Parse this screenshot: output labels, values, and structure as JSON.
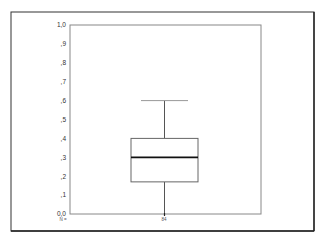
{
  "chart_data": {
    "type": "box",
    "title": "",
    "xlabel": "",
    "ylabel": "",
    "ylim": [
      0.0,
      1.0
    ],
    "y_ticks": [
      "0,0",
      ",1",
      ",2",
      ",3",
      ",4",
      ",5",
      ",6",
      ",7",
      ",8",
      ",9",
      "1,0"
    ],
    "y_tick_values": [
      0.0,
      0.1,
      0.2,
      0.3,
      0.4,
      0.5,
      0.6,
      0.7,
      0.8,
      0.9,
      1.0
    ],
    "grid": false,
    "legend": null,
    "boxes": [
      {
        "label": "",
        "n": 84,
        "whisker_low": 0.0,
        "q1": 0.17,
        "median": 0.3,
        "q3": 0.4,
        "whisker_high": 0.6
      }
    ],
    "n_prefix": "N =",
    "n_value": "84"
  },
  "colors": {
    "frame": "#333333",
    "axis": "#777777",
    "box_line": "#666666",
    "median": "#111111",
    "whisker": "#555555"
  }
}
